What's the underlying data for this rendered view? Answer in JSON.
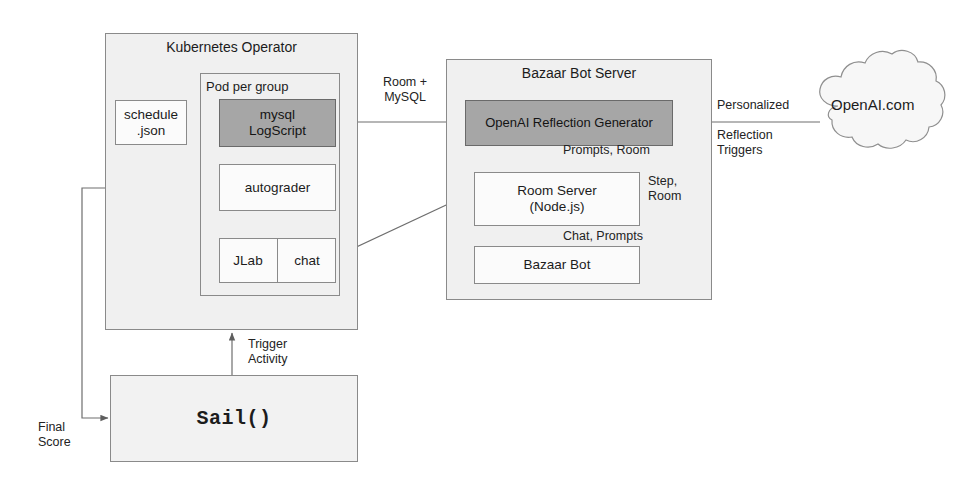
{
  "diagram": {
    "colors": {
      "shaded_fill": "#a6a6a6",
      "container_fill": "#f0f0f0",
      "node_fill": "#fbfbfb",
      "stroke": "#8a8a8a",
      "text": "#1c1c1c"
    }
  },
  "kubernetes": {
    "title": "Kubernetes Operator",
    "pod": {
      "title": "Pod per group",
      "mysql_logscript": "mysql\nLogScript",
      "autograder": "autograder",
      "jlab": "JLab",
      "chat": "chat"
    },
    "schedule": "schedule\n.json"
  },
  "bazaar": {
    "title": "Bazaar Bot Server",
    "reflection_generator": "OpenAI Reflection Generator",
    "room_server": "Room Server\n(Node.js)",
    "bazaar_bot": "Bazaar Bot"
  },
  "cloud": {
    "label": "OpenAI.com"
  },
  "sail": {
    "label": "Sail()"
  },
  "edges": {
    "room_mysql": "Room +\nMySQL",
    "prompts_room": "Prompts, Room",
    "chat_prompts": "Chat, Prompts",
    "step_room": "Step,\nRoom",
    "personalized": "Personalized",
    "reflection_triggers": "Reflection\nTriggers",
    "trigger_activity": "Trigger\nActivity",
    "final_score": "Final\nScore"
  }
}
